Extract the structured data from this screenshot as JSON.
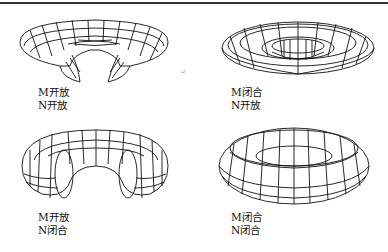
{
  "panels": [
    {
      "id": "m-open-n-open",
      "line1": "M开放",
      "line2": "N开放",
      "shape": "half-open-disc"
    },
    {
      "id": "m-closed-n-open",
      "line1": "M闭合",
      "line2": "N开放",
      "shape": "flat-ring"
    },
    {
      "id": "m-open-n-closed",
      "line1": "M开放",
      "line2": "N闭合",
      "shape": "cut-torus"
    },
    {
      "id": "m-closed-n-closed",
      "line1": "M闭合",
      "line2": "N闭合",
      "shape": "full-torus"
    }
  ],
  "marker": "↵"
}
